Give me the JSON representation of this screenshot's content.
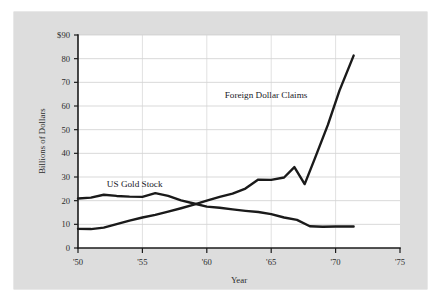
{
  "figure": {
    "background_color": "#dddddd",
    "plot_background_color": "#ffffff",
    "line_color": "#1a1a1a",
    "gridline_color": "#c9c9c9",
    "axis_color": "#1b1b1b"
  },
  "chart_data": {
    "type": "line",
    "title": "",
    "subtitle": "",
    "xlabel": "Year",
    "ylabel": "Billions of Dollars",
    "xlim": [
      1950,
      1975
    ],
    "ylim": [
      0,
      90
    ],
    "x_tick_labels": [
      "'50",
      "'55",
      "'60",
      "'65",
      "'70",
      "'75"
    ],
    "x_tick_values": [
      1950,
      1955,
      1960,
      1965,
      1970,
      1975
    ],
    "y_tick_labels": [
      "0",
      "10",
      "20",
      "30",
      "40",
      "50",
      "60",
      "70",
      "80",
      "$90"
    ],
    "y_tick_values": [
      0,
      10,
      20,
      30,
      40,
      50,
      60,
      70,
      80,
      90
    ],
    "grid": "horizontal",
    "legend_position": "inline-annotation",
    "series": [
      {
        "name": "US Gold Stock",
        "annotation_label": "US Gold Stock",
        "annotation_x": 1954.4,
        "annotation_y": 25.6,
        "x": [
          1950,
          1951,
          1952,
          1953,
          1954,
          1955,
          1956,
          1957,
          1958,
          1959,
          1960,
          1961,
          1962,
          1963,
          1964,
          1965,
          1966,
          1967,
          1968,
          1969,
          1970,
          1971.4
        ],
        "values": [
          20.9,
          21.3,
          22.5,
          22.0,
          21.7,
          21.6,
          23.2,
          22.0,
          20.1,
          18.8,
          17.5,
          17.0,
          16.3,
          15.7,
          15.2,
          14.3,
          12.9,
          11.9,
          9.2,
          9.0,
          9.1,
          9.1
        ]
      },
      {
        "name": "Foreign Dollar Claims",
        "annotation_label": "Foreign Dollar Claims",
        "annotation_x": 1964.6,
        "annotation_y": 63.5,
        "x": [
          1950,
          1951,
          1952,
          1953,
          1954,
          1955,
          1956,
          1957,
          1958,
          1959,
          1960,
          1961,
          1962,
          1963,
          1964,
          1965,
          1966,
          1966.8,
          1967.6,
          1968.4,
          1969.4,
          1970.3,
          1971.4
        ],
        "values": [
          8.1,
          8.0,
          8.6,
          10.1,
          11.6,
          12.9,
          14.0,
          15.4,
          16.8,
          18.3,
          20.0,
          21.6,
          23.0,
          25.1,
          28.9,
          28.8,
          29.8,
          34.2,
          27.0,
          38.0,
          52.0,
          66.5,
          81.3
        ]
      }
    ]
  }
}
